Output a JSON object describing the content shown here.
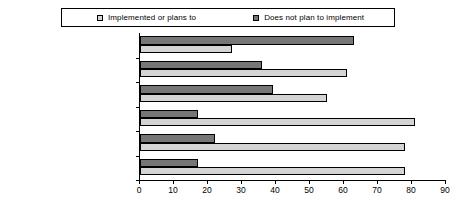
{
  "chart_data": {
    "type": "bar",
    "orientation": "horizontal",
    "title": "",
    "xlabel": "",
    "ylabel": "",
    "xlim": [
      0,
      90
    ],
    "xticks": [
      0,
      10,
      20,
      30,
      40,
      50,
      60,
      70,
      80,
      90
    ],
    "grid": false,
    "legend_position": "top",
    "categories": [
      "Restricting executive compensation",
      "Board approval of non-audit services by auditors",
      "Establishment of whistle-blower procedures",
      "Establishment of corporate ethical code",
      "Audit committee oversight of auditors",
      "Establishment of independent directors"
    ],
    "series": [
      {
        "name": "Implemented or plans to",
        "color": "#d4d4d4",
        "values": [
          27,
          61,
          55,
          81,
          78,
          78
        ]
      },
      {
        "name": "Does not plan to implement",
        "color": "#767676",
        "values": [
          63,
          36,
          39,
          17,
          22,
          17
        ]
      }
    ]
  },
  "legend": {
    "items": [
      {
        "label": "Implemented or plans to",
        "swatch": "light-square-marker"
      },
      {
        "label": "Does not plan to implement",
        "swatch": "dark-square-marker"
      }
    ]
  },
  "categories_display": [
    {
      "line1": "Restricting executive",
      "line2": "compensation"
    },
    {
      "line1": "Board approval of non-audit",
      "line2": "services by auditors"
    },
    {
      "line1": "Establishment of whistle-",
      "line2": "blower procedures"
    },
    {
      "line1": "Establishment of corporate",
      "line2": "ethical code"
    },
    {
      "line1": "Audit committee oversight of",
      "line2": "auditors"
    },
    {
      "line1": "Establishment of",
      "line2": "independent directors"
    }
  ],
  "axis": {
    "tick_labels": [
      "0",
      "10",
      "20",
      "30",
      "40",
      "50",
      "60",
      "70",
      "80",
      "90"
    ]
  }
}
